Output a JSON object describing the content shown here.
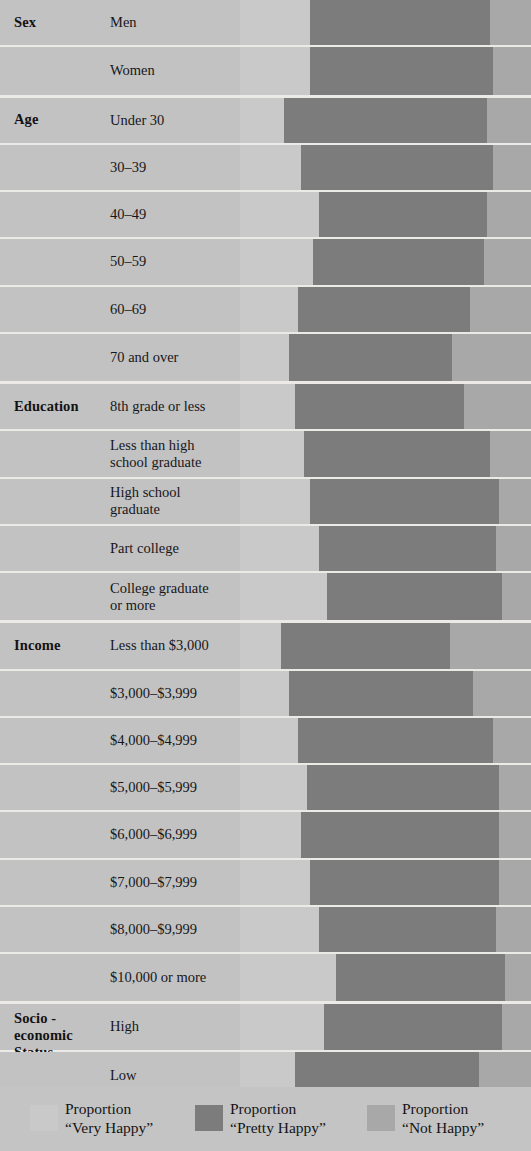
{
  "colors": {
    "very_happy": "#c9c9c9",
    "pretty_happy": "#7c7c7c",
    "not_happy": "#a8a8a8",
    "background": "#c2c2c2",
    "separator": "#eceae6"
  },
  "legend": {
    "items": [
      {
        "swatch": "very-happy-swatch",
        "line1": "Proportion",
        "line2": "“Very Happy”",
        "color": "#c9c9c9"
      },
      {
        "swatch": "pretty-happy-swatch",
        "line1": "Proportion",
        "line2": "“Pretty Happy”",
        "color": "#7c7c7c"
      },
      {
        "swatch": "not-happy-swatch",
        "line1": "Proportion",
        "line2": "“Not Happy”",
        "color": "#a8a8a8"
      }
    ]
  },
  "chart_data": {
    "type": "bar",
    "orientation": "horizontal",
    "stacked": true,
    "normalized": true,
    "title": "",
    "xlabel": "",
    "ylabel": "",
    "xlim": [
      0,
      100
    ],
    "grid": false,
    "legend_position": "bottom",
    "series": [
      {
        "name": "Proportion “Very Happy”",
        "color": "#c9c9c9"
      },
      {
        "name": "Proportion “Pretty Happy”",
        "color": "#7c7c7c"
      },
      {
        "name": "Proportion “Not Happy”",
        "color": "#a8a8a8"
      }
    ],
    "groups": [
      {
        "group": "Sex",
        "rows": [
          {
            "label": "Men",
            "very_happy": 24,
            "pretty_happy": 62,
            "not_happy": 14
          },
          {
            "label": "Women",
            "very_happy": 24,
            "pretty_happy": 63,
            "not_happy": 13
          }
        ]
      },
      {
        "group": "Age",
        "rows": [
          {
            "label": "Under 30",
            "very_happy": 15,
            "pretty_happy": 70,
            "not_happy": 15
          },
          {
            "label": "30–39",
            "very_happy": 21,
            "pretty_happy": 66,
            "not_happy": 13
          },
          {
            "label": "40–49",
            "very_happy": 27,
            "pretty_happy": 58,
            "not_happy": 15
          },
          {
            "label": "50–59",
            "very_happy": 25,
            "pretty_happy": 59,
            "not_happy": 16
          },
          {
            "label": "60–69",
            "very_happy": 20,
            "pretty_happy": 59,
            "not_happy": 21
          },
          {
            "label": "70 and over",
            "very_happy": 17,
            "pretty_happy": 56,
            "not_happy": 27
          }
        ]
      },
      {
        "group": "Education",
        "rows": [
          {
            "label": "8th grade or less",
            "very_happy": 19,
            "pretty_happy": 58,
            "not_happy": 23
          },
          {
            "label": "Less than high\nschool graduate",
            "very_happy": 22,
            "pretty_happy": 64,
            "not_happy": 14
          },
          {
            "label": "High school\ngraduate",
            "very_happy": 24,
            "pretty_happy": 65,
            "not_happy": 11
          },
          {
            "label": "Part college",
            "very_happy": 27,
            "pretty_happy": 61,
            "not_happy": 12
          },
          {
            "label": "College graduate\nor more",
            "very_happy": 30,
            "pretty_happy": 60,
            "not_happy": 10
          }
        ]
      },
      {
        "group": "Income",
        "rows": [
          {
            "label": "Less than $3,000",
            "very_happy": 14,
            "pretty_happy": 58,
            "not_happy": 28
          },
          {
            "label": "$3,000–$3,999",
            "very_happy": 17,
            "pretty_happy": 63,
            "not_happy": 20
          },
          {
            "label": "$4,000–$4,999",
            "very_happy": 20,
            "pretty_happy": 67,
            "not_happy": 13
          },
          {
            "label": "$5,000–$5,999",
            "very_happy": 23,
            "pretty_happy": 66,
            "not_happy": 11
          },
          {
            "label": "$6,000–$6,999",
            "very_happy": 21,
            "pretty_happy": 68,
            "not_happy": 11
          },
          {
            "label": "$7,000–$7,999",
            "very_happy": 24,
            "pretty_happy": 65,
            "not_happy": 11
          },
          {
            "label": "$8,000–$9,999",
            "very_happy": 27,
            "pretty_happy": 61,
            "not_happy": 12
          },
          {
            "label": "$10,000 or  more",
            "very_happy": 33,
            "pretty_happy": 58,
            "not_happy": 9
          }
        ]
      },
      {
        "group": "Socio -\neconomic\nStatus",
        "rows": [
          {
            "label": "High",
            "very_happy": 29,
            "pretty_happy": 61,
            "not_happy": 10
          },
          {
            "label": "Low",
            "very_happy": 19,
            "pretty_happy": 63,
            "not_happy": 18
          }
        ]
      }
    ]
  }
}
